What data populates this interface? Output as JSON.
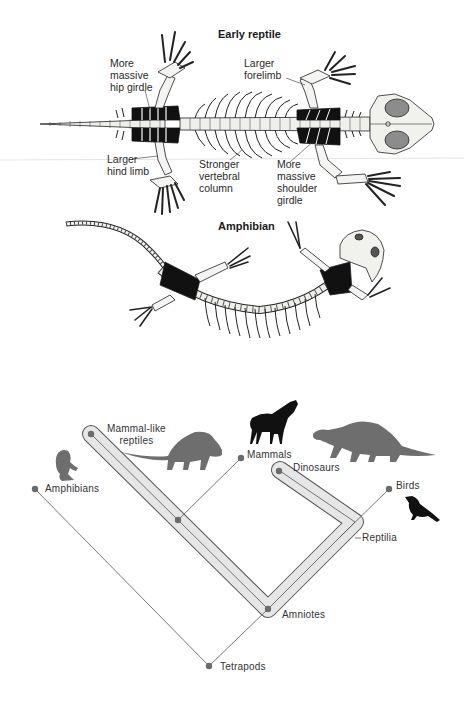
{
  "figure": {
    "top_panel": {
      "title": "Early reptile",
      "annotations": [
        {
          "id": "hip",
          "text": "More\nmassive\nhip girdle"
        },
        {
          "id": "forelimb",
          "text": "Larger\nforelimb"
        },
        {
          "id": "hindlimb",
          "text": "Larger\nhind limb"
        },
        {
          "id": "vertebral",
          "text": "Stronger\nvertebral\ncolumn"
        },
        {
          "id": "shoulder",
          "text": "More\nmassive\nshoulder\ngirdle"
        }
      ]
    },
    "middle_panel": {
      "title": "Amphibian"
    },
    "cladogram": {
      "nodes": [
        {
          "id": "amphibians",
          "label": "Amphibians"
        },
        {
          "id": "mammal_like",
          "label": "Mammal-like\nreptiles"
        },
        {
          "id": "mammals",
          "label": "Mammals"
        },
        {
          "id": "dinosaurs",
          "label": "Dinosaurs"
        },
        {
          "id": "birds",
          "label": "Birds"
        },
        {
          "id": "reptilia",
          "label": "Reptilia"
        },
        {
          "id": "amniotes",
          "label": "Amniotes"
        },
        {
          "id": "tetrapods",
          "label": "Tetrapods"
        }
      ],
      "silhouettes": [
        "frog-icon",
        "dimetrodon-like-icon",
        "horse-icon",
        "dinosaur-icon",
        "bird-icon"
      ],
      "colors": {
        "line": "#555555",
        "node": "#6b6b6b",
        "band_fill": "#e6e6e6",
        "band_stroke": "#555555",
        "silhouette_gray": "#6e6e6e",
        "silhouette_black": "#111111"
      }
    }
  }
}
